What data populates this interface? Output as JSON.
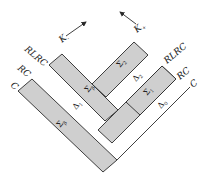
{
  "diagram": {
    "colors": {
      "band_fill": "#cfcfcf",
      "stroke": "#2a2a2a",
      "background": "#ffffff"
    },
    "arrows": [
      {
        "label": "K",
        "subscript": "-",
        "direction": "up-right"
      },
      {
        "label": "K",
        "subscript": "+",
        "direction": "up-left"
      }
    ],
    "left_labels": [
      {
        "text": "RLRC"
      },
      {
        "text": "RC"
      },
      {
        "text": "C"
      }
    ],
    "right_labels": [
      {
        "text": "RLRC"
      },
      {
        "text": "RC"
      },
      {
        "text": "C"
      }
    ],
    "regions": [
      {
        "symbol": "Σ",
        "subscript": "β",
        "position": "upper-left band"
      },
      {
        "symbol": "Σ",
        "subscript": "β",
        "position": "lower-left band"
      },
      {
        "symbol": "Δ",
        "subscript": "1",
        "position": "left white channel"
      },
      {
        "symbol": "Σ",
        "subscript": "2",
        "position": "upper-right band"
      },
      {
        "symbol": "Δ",
        "subscript": "2",
        "position": "right white channel upper"
      },
      {
        "symbol": "Σ",
        "subscript": "1",
        "position": "lower-right band"
      },
      {
        "symbol": "Δ",
        "subscript": "0",
        "position": "right white channel lower"
      }
    ]
  }
}
